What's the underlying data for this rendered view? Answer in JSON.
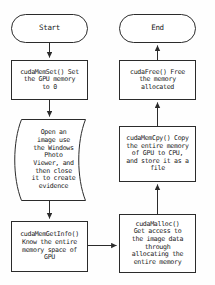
{
  "diagram": {
    "type": "flowchart",
    "stroke_color": "#2b2b2b",
    "fill_color": "#ffffff",
    "text_color": "#1a1a1a",
    "background_color": "#fefefe"
  },
  "nodes": {
    "start": {
      "label": "Start",
      "shape": "terminator-rounded"
    },
    "end": {
      "label": "End",
      "shape": "terminator-rounded"
    },
    "cuda_memset": {
      "label": "cudaMemSet() Set\nthe GPU memory\nto 0",
      "shape": "process-rectangle"
    },
    "open_image": {
      "label": "Open an\nimage use\nthe Windows\nPhoto\nViewer, and\nthen close\nit to create\nevidence",
      "shape": "manual-operation-curved"
    },
    "cuda_memgetinfo": {
      "label": "cudaMemGetInfo()\nKnow the entire\nmemory space of\nGPU",
      "shape": "process-rectangle"
    },
    "cuda_malloc": {
      "label": "cudaMalloc()\nGet access to\nthe image data\nthrough\nallocating the\nentire memory",
      "shape": "process-rectangle"
    },
    "cuda_memcpy": {
      "label": "cudaMemCpy() Copy\nthe entire memory\nof GPU to CPU,\nand store it as a\nfile",
      "shape": "process-rectangle"
    },
    "cuda_free": {
      "label": "cudaFree() Free\nthe memory\nallocated",
      "shape": "process-rectangle"
    }
  },
  "edges": [
    {
      "from": "start",
      "to": "cuda_memset",
      "direction": "down"
    },
    {
      "from": "cuda_memset",
      "to": "open_image",
      "direction": "down"
    },
    {
      "from": "open_image",
      "to": "cuda_memgetinfo",
      "direction": "down"
    },
    {
      "from": "cuda_memgetinfo",
      "to": "cuda_malloc",
      "direction": "right"
    },
    {
      "from": "cuda_malloc",
      "to": "cuda_memcpy",
      "direction": "up"
    },
    {
      "from": "cuda_memcpy",
      "to": "cuda_free",
      "direction": "up"
    },
    {
      "from": "cuda_free",
      "to": "end",
      "direction": "up"
    }
  ]
}
